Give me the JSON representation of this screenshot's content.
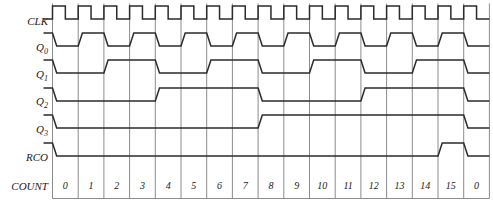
{
  "diagram": {
    "type": "timing-diagram",
    "row_labels": [
      "CLK",
      "Q",
      "Q",
      "Q",
      "Q",
      "RCO",
      "COUNT"
    ],
    "signals": [
      {
        "name": "CLK",
        "label": "CLK",
        "subscript": "",
        "kind": "clock"
      },
      {
        "name": "Q0",
        "label": "Q",
        "subscript": "0",
        "kind": "data"
      },
      {
        "name": "Q1",
        "label": "Q",
        "subscript": "1",
        "kind": "data"
      },
      {
        "name": "Q2",
        "label": "Q",
        "subscript": "2",
        "kind": "data"
      },
      {
        "name": "Q3",
        "label": "Q",
        "subscript": "3",
        "kind": "data"
      },
      {
        "name": "RCO",
        "label": "RCO",
        "subscript": "",
        "kind": "data"
      },
      {
        "name": "COUNT",
        "label": "COUNT",
        "subscript": "",
        "kind": "axis"
      }
    ],
    "count_labels": [
      "0",
      "1",
      "2",
      "3",
      "4",
      "5",
      "6",
      "7",
      "8",
      "9",
      "10",
      "11",
      "12",
      "13",
      "14",
      "15",
      "0"
    ],
    "cells": 17,
    "colors": {
      "trace": "#2b2b2b",
      "gridline": "#8c8c8c",
      "background": "#ffffff",
      "text": "#1a1a1a"
    }
  },
  "chart_data": {
    "type": "line",
    "xlabel": "COUNT",
    "ylabel": "",
    "x": [
      "0",
      "1",
      "2",
      "3",
      "4",
      "5",
      "6",
      "7",
      "8",
      "9",
      "10",
      "11",
      "12",
      "13",
      "14",
      "15",
      "0"
    ],
    "series": [
      {
        "name": "CLK",
        "values": [
          1,
          1,
          1,
          1,
          1,
          1,
          1,
          1,
          1,
          1,
          1,
          1,
          1,
          1,
          1,
          1,
          1
        ],
        "note": "rises at each count boundary, 50% duty cycle"
      },
      {
        "name": "Q0",
        "values": [
          0,
          1,
          0,
          1,
          0,
          1,
          0,
          1,
          0,
          1,
          0,
          1,
          0,
          1,
          0,
          1,
          0
        ]
      },
      {
        "name": "Q1",
        "values": [
          0,
          0,
          1,
          1,
          0,
          0,
          1,
          1,
          0,
          0,
          1,
          1,
          0,
          0,
          1,
          1,
          0
        ]
      },
      {
        "name": "Q2",
        "values": [
          0,
          0,
          0,
          0,
          1,
          1,
          1,
          1,
          0,
          0,
          0,
          0,
          1,
          1,
          1,
          1,
          0
        ]
      },
      {
        "name": "Q3",
        "values": [
          0,
          0,
          0,
          0,
          0,
          0,
          0,
          0,
          1,
          1,
          1,
          1,
          1,
          1,
          1,
          1,
          0
        ]
      },
      {
        "name": "RCO",
        "values": [
          0,
          0,
          0,
          0,
          0,
          0,
          0,
          0,
          0,
          0,
          0,
          0,
          0,
          0,
          0,
          1,
          0
        ]
      }
    ],
    "grid": true,
    "legend": "left-axis-labels"
  }
}
